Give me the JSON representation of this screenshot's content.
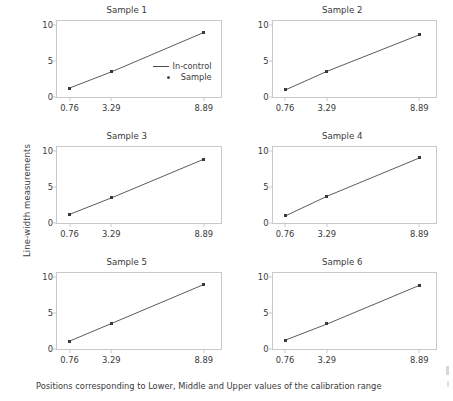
{
  "figure": {
    "ylabel": "Line-width measurements",
    "caption": "Positions corresponding to Lower, Middle and Upper values of the calibration range"
  },
  "legend": {
    "line_label": "In-control",
    "marker_label": "Sample"
  },
  "chart_data": {
    "type": "line",
    "title": "",
    "xlabel": "Positions corresponding to Lower, Middle and Upper values of the calibration range",
    "ylabel": "Line-width measurements",
    "x": [
      0.76,
      3.29,
      8.89
    ],
    "xtick_labels": [
      "0.76",
      "3.29",
      "8.89"
    ],
    "ytick_labels": [
      "0",
      "5",
      "10"
    ],
    "yticks": [
      0,
      5,
      10
    ],
    "xlim": [
      0.0,
      9.9
    ],
    "ylim": [
      0,
      10.6
    ],
    "grid": false,
    "legend_position": "panel-1-inside-right",
    "layout": "2 columns x 3 rows small multiples",
    "panels": [
      {
        "title": "Sample 1",
        "series": [
          {
            "name": "In-control",
            "values": [
              1.25,
              3.5,
              9.0
            ]
          },
          {
            "name": "Sample",
            "values": [
              1.25,
              3.5,
              9.0
            ]
          }
        ]
      },
      {
        "title": "Sample 2",
        "series": [
          {
            "name": "In-control",
            "values": [
              1.0,
              3.6,
              8.7
            ]
          },
          {
            "name": "Sample",
            "values": [
              1.0,
              3.6,
              8.7
            ]
          }
        ]
      },
      {
        "title": "Sample 3",
        "series": [
          {
            "name": "In-control",
            "values": [
              1.2,
              3.5,
              8.9
            ]
          },
          {
            "name": "Sample",
            "values": [
              1.2,
              3.5,
              8.9
            ]
          }
        ]
      },
      {
        "title": "Sample 4",
        "series": [
          {
            "name": "In-control",
            "values": [
              1.0,
              3.75,
              9.1
            ]
          },
          {
            "name": "Sample",
            "values": [
              1.0,
              3.75,
              9.1
            ]
          }
        ]
      },
      {
        "title": "Sample 5",
        "series": [
          {
            "name": "In-control",
            "values": [
              1.1,
              3.55,
              9.0
            ]
          },
          {
            "name": "Sample",
            "values": [
              1.1,
              3.55,
              9.0
            ]
          }
        ]
      },
      {
        "title": "Sample 6",
        "series": [
          {
            "name": "In-control",
            "values": [
              1.25,
              3.5,
              8.9
            ]
          },
          {
            "name": "Sample",
            "values": [
              1.25,
              3.5,
              8.9
            ]
          }
        ]
      }
    ],
    "colors": {
      "line": "#4a4a4a",
      "marker": "#3a3a3a",
      "axis": "#c9c9c9",
      "text": "#3a3a3a",
      "background": "#ffffff"
    }
  }
}
